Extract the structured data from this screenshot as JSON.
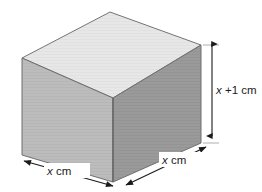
{
  "figure": {
    "background_color": "#ffffff",
    "width": 262,
    "height": 192,
    "shape": {
      "name": "cuboid",
      "projection": "oblique",
      "faces": {
        "top": {
          "label": "top-face",
          "color": "#e6e6e6"
        },
        "left": {
          "label": "left-front-face",
          "color": "#bababa"
        },
        "right": {
          "label": "right-front-face",
          "color": "#9a9a9a"
        }
      },
      "edge_color": "#6e6e6e"
    },
    "dimensions": [
      {
        "id": "height",
        "name": "height-dimension",
        "orientation": "vertical",
        "label_var": "x",
        "label_rest": " +1 cm",
        "label_full": "x +1 cm",
        "arrow_color": "#1b1b1b"
      },
      {
        "id": "width",
        "name": "width-dimension",
        "orientation": "diagonal-left",
        "label_var": "x",
        "label_rest": " cm",
        "label_full": "x cm",
        "arrow_color": "#1b1b1b"
      },
      {
        "id": "depth",
        "name": "depth-dimension",
        "orientation": "diagonal-right",
        "label_var": "x",
        "label_rest": " cm",
        "label_full": "x cm",
        "arrow_color": "#1b1b1b"
      }
    ]
  }
}
